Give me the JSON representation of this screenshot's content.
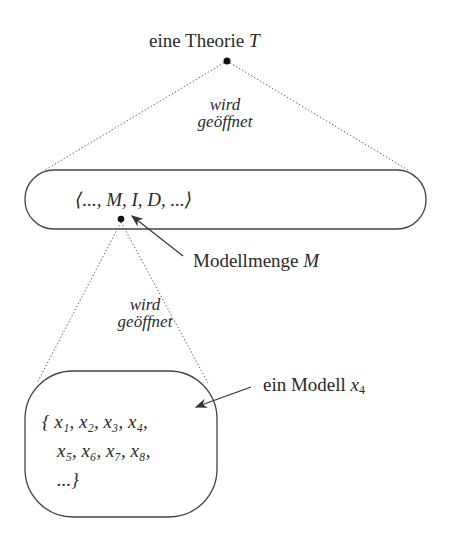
{
  "diagram": {
    "top_label": {
      "text": "eine Theorie ",
      "var": "T"
    },
    "opened_label_1": {
      "line1": "wird",
      "line2": "geöffnet"
    },
    "tuple": "⟨..., M, I, D, ...⟩",
    "modellmenge_label": {
      "text": "Modellmenge ",
      "var": "M"
    },
    "opened_label_2": {
      "line1": "wird",
      "line2": "geöffnet"
    },
    "set_lines": [
      "{  x₁, x₂, x₃, x₄,",
      "x₅, x₆, x₇, x₈,",
      "...}"
    ],
    "model_label": {
      "text": "ein Modell ",
      "var": "x",
      "sub": "4"
    }
  }
}
